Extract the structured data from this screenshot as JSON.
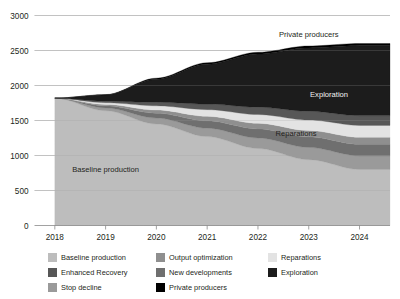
{
  "chart_data": {
    "type": "area",
    "title": "",
    "subtitle": "",
    "xlabel": "",
    "ylabel": "",
    "stacked": true,
    "grid": true,
    "legend_position": "bottom",
    "x": [
      2018,
      2019,
      2020,
      2021,
      2022,
      2023,
      2024
    ],
    "categories": [
      "2018",
      "2019",
      "2020",
      "2021",
      "2022",
      "2023",
      "2024"
    ],
    "xlim": [
      2017.6,
      2024.6
    ],
    "ylim": [
      0,
      3000
    ],
    "yticks": [
      0,
      500,
      1000,
      1500,
      2000,
      2500,
      3000
    ],
    "ytick_labels": [
      "0",
      "500",
      "1000",
      "1500",
      "2000",
      "2500",
      "3000"
    ],
    "xticks": [
      2018,
      2019,
      2020,
      2021,
      2022,
      2023,
      2024
    ],
    "xtick_labels": [
      "2018",
      "2019",
      "2020",
      "2021",
      "2022",
      "2023",
      "2024"
    ],
    "series": [
      {
        "name": "Baseline production",
        "color": "#bdbdbd",
        "values": [
          1820,
          1640,
          1450,
          1270,
          1100,
          940,
          800
        ]
      },
      {
        "name": "Stop decline",
        "color": "#9a9a9a",
        "values": [
          0,
          40,
          85,
          120,
          150,
          175,
          195
        ]
      },
      {
        "name": "New developments",
        "color": "#6f6f6f",
        "values": [
          0,
          30,
          70,
          105,
          130,
          150,
          165
        ]
      },
      {
        "name": "Output optimization",
        "color": "#8f8f8f",
        "values": [
          0,
          20,
          45,
          65,
          80,
          92,
          100
        ]
      },
      {
        "name": "Reparations",
        "color": "#e3e3e3",
        "values": [
          0,
          25,
          60,
          95,
          125,
          150,
          170
        ]
      },
      {
        "name": "Enhanced Recovery",
        "color": "#575757",
        "values": [
          0,
          20,
          50,
          80,
          105,
          125,
          140
        ]
      },
      {
        "name": "Exploration",
        "color": "#1c1c1c",
        "values": [
          0,
          90,
          330,
          570,
          760,
          905,
          1000
        ]
      },
      {
        "name": "Private producers",
        "color": "#000000",
        "values": [
          0,
          5,
          15,
          20,
          25,
          28,
          30
        ]
      }
    ],
    "totals": [
      1820,
      1870,
      2105,
      2325,
      2475,
      2565,
      2600
    ],
    "annotations": [
      {
        "text": "Baseline production",
        "x": 2019.0,
        "y": 760,
        "tone": "dark"
      },
      {
        "text": "Reparations",
        "x": 2022.75,
        "y": 1285,
        "tone": "dark"
      },
      {
        "text": "Exploration",
        "x": 2023.4,
        "y": 1840,
        "tone": "light"
      },
      {
        "text": "Private producers",
        "x": 2023.0,
        "y": 2690,
        "tone": "dark"
      }
    ]
  },
  "legend": {
    "items": [
      {
        "label": "Baseline production",
        "color": "#bdbdbd"
      },
      {
        "label": "Output optimization",
        "color": "#8f8f8f"
      },
      {
        "label": "Reparations",
        "color": "#e3e3e3"
      },
      {
        "label": "Enhanced Recovery",
        "color": "#575757"
      },
      {
        "label": "New developments",
        "color": "#6f6f6f"
      },
      {
        "label": "Exploration",
        "color": "#1c1c1c"
      },
      {
        "label": "Stop decline",
        "color": "#9a9a9a"
      },
      {
        "label": "Private producers",
        "color": "#000000"
      }
    ],
    "order": [
      0,
      1,
      2,
      3,
      4,
      5,
      6,
      7
    ]
  }
}
